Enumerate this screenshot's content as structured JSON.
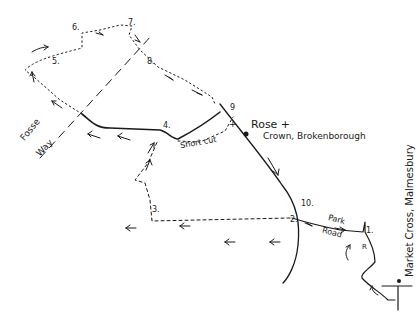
{
  "map": {
    "title": "",
    "waypoints": [
      {
        "id": "1",
        "label": "1.",
        "x": 365,
        "y": 231
      },
      {
        "id": "2",
        "label": "2.",
        "x": 292,
        "y": 221
      },
      {
        "id": "3",
        "label": "3.",
        "x": 152,
        "y": 211
      },
      {
        "id": "4",
        "label": "4.",
        "x": 163,
        "y": 127
      },
      {
        "id": "5",
        "label": "5.",
        "x": 52,
        "y": 63
      },
      {
        "id": "6",
        "label": "6.",
        "x": 72,
        "y": 29
      },
      {
        "id": "7",
        "label": "7.",
        "x": 128,
        "y": 24
      },
      {
        "id": "8",
        "label": "8.",
        "x": 147,
        "y": 61
      },
      {
        "id": "9",
        "label": "9",
        "x": 230,
        "y": 109
      },
      {
        "id": "10",
        "label": "10.",
        "x": 302,
        "y": 203
      }
    ],
    "labels": {
      "pub": "Rose +",
      "pub_location": "Crown, Brokenborough",
      "fosse": "Fosse",
      "way": "Way",
      "short_cut": "Short cut",
      "park": "Park",
      "road": "Road",
      "market_cross": "Market Cross, Malmesbury",
      "route_marker_r": "R",
      "cross_marker": "+"
    },
    "colors": {
      "ink": "#1a1a1a",
      "background": "#ffffff"
    }
  }
}
